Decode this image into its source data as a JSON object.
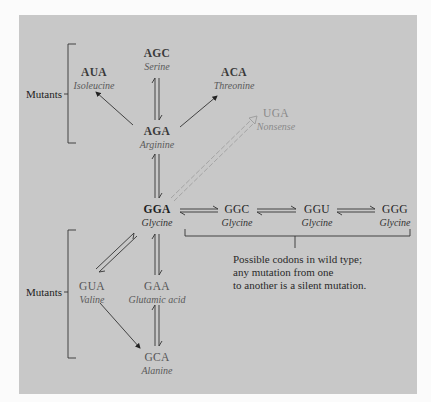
{
  "diagram": {
    "nodes": {
      "agc": {
        "codon": "AGC",
        "amino_acid": "Serine"
      },
      "aua": {
        "codon": "AUA",
        "amino_acid": "Isoleucine"
      },
      "aca": {
        "codon": "ACA",
        "amino_acid": "Threonine"
      },
      "aga": {
        "codon": "AGA",
        "amino_acid": "Arginine"
      },
      "uga": {
        "codon": "UGA",
        "amino_acid": "Nonsense"
      },
      "gga": {
        "codon": "GGA",
        "amino_acid": "Glycine"
      },
      "ggc": {
        "codon": "GGC",
        "amino_acid": "Glycine"
      },
      "ggu": {
        "codon": "GGU",
        "amino_acid": "Glycine"
      },
      "ggg": {
        "codon": "GGG",
        "amino_acid": "Glycine"
      },
      "gua": {
        "codon": "GUA",
        "amino_acid": "Valine"
      },
      "gaa": {
        "codon": "GAA",
        "amino_acid": "Glutamic acid"
      },
      "gca": {
        "codon": "GCA",
        "amino_acid": "Alanine"
      }
    },
    "labels": {
      "mutants_top": "Mutants",
      "mutants_bottom": "Mutants"
    },
    "note": {
      "line1": "Possible codons in wild type;",
      "line2": "any mutation from one",
      "line3": "to another is a silent mutation."
    },
    "edges": [
      {
        "from": "AGA",
        "to": "AGC",
        "type": "reversible"
      },
      {
        "from": "AGA",
        "to": "AUA",
        "type": "forward"
      },
      {
        "from": "AGA",
        "to": "ACA",
        "type": "forward"
      },
      {
        "from": "GGA",
        "to": "AGA",
        "type": "reversible"
      },
      {
        "from": "GGA",
        "to": "UGA",
        "type": "hollow-forward"
      },
      {
        "from": "GGA",
        "to": "GGC",
        "type": "reversible"
      },
      {
        "from": "GGC",
        "to": "GGU",
        "type": "reversible"
      },
      {
        "from": "GGU",
        "to": "GGG",
        "type": "reversible"
      },
      {
        "from": "GGA",
        "to": "GUA",
        "type": "reversible"
      },
      {
        "from": "GGA",
        "to": "GAA",
        "type": "reversible"
      },
      {
        "from": "GAA",
        "to": "GCA",
        "type": "reversible"
      },
      {
        "from": "GUA",
        "to": "GCA",
        "type": "forward"
      }
    ],
    "colors": {
      "panel": "#c8c8c8",
      "page": "#fbfbfb",
      "ink": "#222222",
      "faint": "#8a8a8a"
    }
  }
}
